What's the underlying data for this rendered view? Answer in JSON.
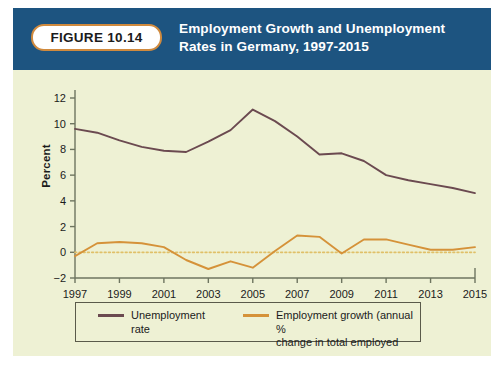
{
  "figure": {
    "badge_label": "FIGURE 10.14",
    "title_line1": "Employment Growth and Unemployment",
    "title_line2": "Rates in Germany, 1997-2015",
    "header_color": "#1d5480",
    "badge_border_color": "#d08a3e",
    "background_color": "#eef1d4"
  },
  "legend": {
    "items": [
      {
        "label": "Unemployment rate",
        "label_line2": "",
        "color": "#6b4a50"
      },
      {
        "label": "Employment growth (annual %",
        "label_line2": "change in total employed",
        "color": "#d59239"
      }
    ]
  },
  "chart_data": {
    "type": "line",
    "title": "Employment Growth and Unemployment Rates in Germany, 1997-2015",
    "xlabel": "",
    "ylabel": "Percent",
    "xlim": [
      1997,
      2015
    ],
    "ylim": [
      -2,
      12
    ],
    "yticks": [
      -2,
      0,
      2,
      4,
      6,
      8,
      10,
      12
    ],
    "ytick_labels": [
      "−2",
      "0",
      "2",
      "4",
      "6",
      "8",
      "10",
      "12"
    ],
    "xticks": [
      1997,
      1999,
      2001,
      2003,
      2005,
      2007,
      2009,
      2011,
      2013,
      2015
    ],
    "xtick_labels": [
      "1997",
      "1999",
      "2001",
      "2003",
      "2005",
      "2007",
      "2009",
      "2011",
      "2013",
      "2015"
    ],
    "grid": false,
    "zero_line": true,
    "zero_line_color": "#e0c068",
    "legend_position": "bottom",
    "x": [
      1997,
      1998,
      1999,
      2000,
      2001,
      2002,
      2003,
      2004,
      2005,
      2006,
      2007,
      2008,
      2009,
      2010,
      2011,
      2012,
      2013,
      2014,
      2015
    ],
    "series": [
      {
        "name": "Unemployment rate",
        "color": "#6b4a50",
        "values": [
          9.6,
          9.3,
          8.7,
          8.2,
          7.9,
          7.8,
          8.6,
          9.5,
          11.1,
          10.2,
          9.0,
          7.6,
          7.7,
          7.1,
          6.0,
          5.6,
          5.3,
          5.0,
          4.6
        ]
      },
      {
        "name": "Employment growth (annual % change in total employed)",
        "color": "#d59239",
        "values": [
          -0.3,
          0.7,
          0.8,
          0.7,
          0.4,
          -0.6,
          -1.3,
          -0.7,
          -1.2,
          0.1,
          1.3,
          1.2,
          -0.1,
          1.0,
          1.0,
          0.6,
          0.2,
          0.2,
          0.4
        ]
      }
    ]
  },
  "geometry": {
    "plot_left": 62,
    "plot_right": 462,
    "plot_top": 28,
    "plot_bottom": 208
  }
}
